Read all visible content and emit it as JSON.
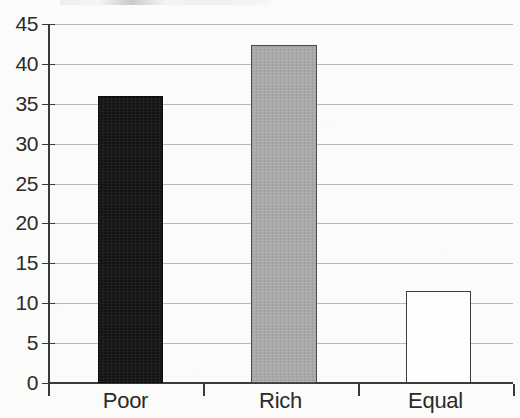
{
  "chart_data": {
    "type": "bar",
    "title": "",
    "title_remnant": "",
    "xlabel": "",
    "ylabel": "",
    "categories": [
      "Poor",
      "Rich",
      "Equal"
    ],
    "values": [
      36,
      42.4,
      11.5
    ],
    "series": [
      {
        "name": "Response share",
        "values": [
          36,
          42.4,
          11.5
        ]
      }
    ],
    "ylim": [
      0,
      45
    ],
    "yticks": [
      0,
      5,
      10,
      15,
      20,
      25,
      30,
      35,
      40,
      45
    ],
    "ytick_labels": [
      "0",
      "5",
      "10",
      "15",
      "20",
      "25",
      "30",
      "35",
      "40",
      "45"
    ],
    "grid": true,
    "grid_axis": "y",
    "legend": false,
    "legend_position": "none",
    "bar_colors": [
      "#141414",
      "#a8a8a8",
      "#fefefe"
    ],
    "bar_border_colors": [
      "#0c0c0c",
      "#4b4b4b",
      "#3d3d3d"
    ],
    "axis_color": "#3a3a3a",
    "gridline_color": "#b9b9b9",
    "background_color": "#fbfbfa",
    "text_color": "#2b2b2b"
  }
}
